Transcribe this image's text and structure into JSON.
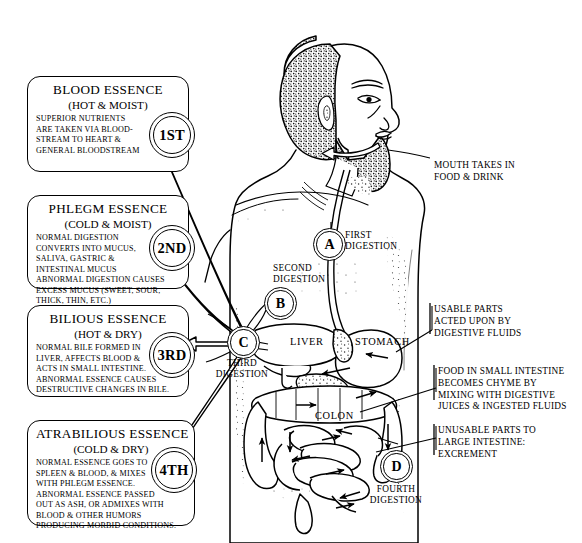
{
  "diagram": {
    "ink_color": "#000000",
    "background_color": "#ffffff"
  },
  "essences": [
    {
      "ordinal": "1ST",
      "title": "BLOOD ESSENCE",
      "qualities": "(HOT & MOIST)",
      "lines": [
        "SUPERIOR NUTRIENTS",
        "ARE TAKEN VIA BLOOD-",
        "STREAM TO HEART &",
        "GENERAL BLOODSTREAM"
      ]
    },
    {
      "ordinal": "2ND",
      "title": "PHLEGM ESSENCE",
      "qualities": "(COLD & MOIST)",
      "lines": [
        "NORMAL DIGESTION",
        "CONVERTS  INTO MUCUS,",
        "SALIVA, GASTRIC &",
        "INTESTINAL  MUCUS",
        "ABNORMAL DIGESTION  CAUSES",
        "EXCESS MUCUS (SWEET, SOUR,",
        "THICK, THIN, ETC.)"
      ]
    },
    {
      "ordinal": "3RD",
      "title": "BILIOUS ESSENCE",
      "qualities": "(HOT & DRY)",
      "lines": [
        "NORMAL BILE FORMED IN",
        "LIVER, AFFECTS BLOOD &",
        "ACTS IN SMALL INTESTINE.",
        "ABNORMAL ESSENCE CAUSES",
        "DESTRUCTIVE CHANGES IN BILE."
      ]
    },
    {
      "ordinal": "4TH",
      "title": "ATRABILIOUS ESSENCE",
      "qualities": "(COLD & DRY)",
      "lines": [
        "NORMAL ESSENCE GOES TO",
        "SPLEEN & BLOOD, & MIXES",
        "WITH PHLEGM ESSENCE.",
        "ABNORMAL ESSENCE PASSED",
        "OUT AS ASH, OR ADMIXES WITH",
        "BLOOD & OTHER HUMORS",
        "PRODUCING MORBID CONDITIONS."
      ]
    }
  ],
  "stages": [
    {
      "letter": "A",
      "label_line1": "FIRST",
      "label_line2": "DIGESTION"
    },
    {
      "letter": "B",
      "label_line1": "SECOND",
      "label_line2": "DIGESTION"
    },
    {
      "letter": "C",
      "label_line1": "THIRD",
      "label_line2": "DIGESTION"
    },
    {
      "letter": "D",
      "label_line1": "FOURTH",
      "label_line2": "DIGESTION"
    }
  ],
  "callouts": {
    "mouth": {
      "line1": "MOUTH TAKES IN",
      "line2": "FOOD & DRINK"
    },
    "usable_parts": {
      "line1": "USABLE PARTS",
      "line2": "ACTED UPON BY",
      "line3": "DIGESTIVE FLUIDS"
    },
    "chyme": {
      "line1": "FOOD IN SMALL INTESTINE",
      "line2": "BECOMES CHYME BY",
      "line3": "MIXING WITH DIGESTIVE",
      "line4": "JUICES & INGESTED FLUIDS"
    },
    "unusable_parts": {
      "line1": "UNUSABLE PARTS TO",
      "line2": "LARGE INTESTINE:",
      "line3": "EXCREMENT"
    }
  },
  "organs": {
    "liver": "LIVER",
    "stomach": "STOMACH",
    "colon": "COLON"
  }
}
